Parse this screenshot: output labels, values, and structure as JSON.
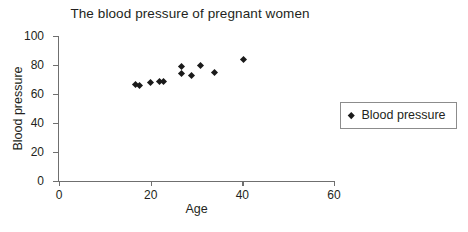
{
  "chart_data": {
    "type": "scatter",
    "title": "The blood pressure of pregnant women",
    "xlabel": "Age",
    "ylabel": "Blood pressure",
    "xlim": [
      0,
      60
    ],
    "ylim": [
      0,
      100
    ],
    "xticks": [
      0,
      20,
      40,
      60
    ],
    "yticks": [
      0,
      20,
      40,
      60,
      80,
      100
    ],
    "grid": false,
    "legend_position": "right-outside",
    "series": [
      {
        "name": "Blood pressure",
        "marker": "diamond",
        "color": "#1a1a1a",
        "points": [
          {
            "x": 16.7,
            "y": 66.7
          },
          {
            "x": 17.5,
            "y": 66.0
          },
          {
            "x": 19.9,
            "y": 67.8
          },
          {
            "x": 22.0,
            "y": 68.5
          },
          {
            "x": 22.8,
            "y": 68.5
          },
          {
            "x": 26.8,
            "y": 79.3
          },
          {
            "x": 26.8,
            "y": 73.8
          },
          {
            "x": 28.8,
            "y": 73.0
          },
          {
            "x": 30.8,
            "y": 80.0
          },
          {
            "x": 33.9,
            "y": 74.7
          },
          {
            "x": 40.2,
            "y": 84.1
          }
        ]
      }
    ]
  },
  "legend": {
    "entries": [
      {
        "label": "Blood pressure",
        "marker_icon": "diamond-marker-icon"
      }
    ]
  },
  "colors": {
    "marker": "#1a1a1a",
    "axis": "#6f6f6f",
    "text": "#231f20",
    "legend_border": "#8c8c8c",
    "background": "#ffffff"
  }
}
